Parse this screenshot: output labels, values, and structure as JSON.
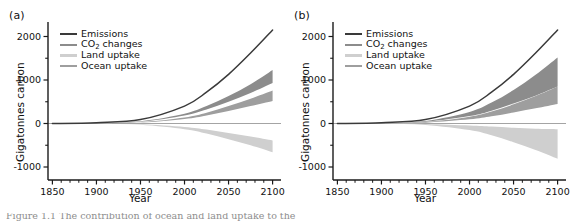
{
  "figure": {
    "width": 569,
    "height": 222,
    "background": "#ffffff",
    "caption_partial": "Figure 1.1  The contribution of ocean and land uptake to the"
  },
  "colors": {
    "emissions": "#3a3a3a",
    "co2_changes": "#8c8c8c",
    "land_uptake": "#cfcfcf",
    "ocean_uptake": "#9e9e9e",
    "axis": "#1a1a1a",
    "zero_line": "#9a9a9a",
    "text": "#111111"
  },
  "axes": {
    "ylabel": "Gigatonnes carbon",
    "xlabel": "Year",
    "ylim": [
      -1400,
      2350
    ],
    "xlim": [
      1845,
      2105
    ],
    "ytick_values": [
      2000,
      1000,
      0,
      -1000
    ],
    "ytick_labels": [
      "2000",
      "1000",
      "0",
      "-1000"
    ],
    "yminor_values": [
      1500,
      500,
      -500
    ],
    "xtick_values": [
      1850,
      1900,
      1950,
      2000,
      2050,
      2100
    ],
    "xtick_labels": [
      "1850",
      "1900",
      "1950",
      "2000",
      "2050",
      "2100"
    ],
    "xminor_step": 10,
    "grid": false
  },
  "legend": {
    "position": "upper-left-inside",
    "entries": [
      {
        "label": "Emissions",
        "key": "emissions",
        "color": "#3a3a3a",
        "has_subscript": false
      },
      {
        "label": "CO2 changes",
        "key": "co2_changes",
        "color": "#8c8c8c",
        "has_subscript": true,
        "label_main": "CO",
        "label_sub": "2",
        "label_tail": " changes"
      },
      {
        "label": "Land uptake",
        "key": "land_uptake",
        "color": "#cfcfcf",
        "has_subscript": false
      },
      {
        "label": "Ocean uptake",
        "key": "ocean_uptake",
        "color": "#9e9e9e",
        "has_subscript": false
      }
    ]
  },
  "panels": [
    {
      "id": "a",
      "tag": "(a)"
    },
    {
      "id": "b",
      "tag": "(b)"
    }
  ],
  "chart_data": [
    {
      "type": "area",
      "panel": "a",
      "title": "(a)",
      "xlabel": "Year",
      "ylabel": "Gigatonnes carbon",
      "xlim": [
        1845,
        2105
      ],
      "ylim": [
        -1400,
        2350
      ],
      "grid": false,
      "legend_position": "upper left",
      "x": [
        1850,
        1900,
        1950,
        2000,
        2025,
        2050,
        2075,
        2100
      ],
      "series": [
        {
          "name": "Emissions",
          "kind": "line",
          "color": "#3a3a3a",
          "values": [
            0,
            20,
            90,
            400,
            720,
            1130,
            1620,
            2150
          ]
        },
        {
          "name": "CO2 changes",
          "kind": "band",
          "color": "#8c8c8c",
          "upper": [
            0,
            12,
            52,
            225,
            400,
            630,
            900,
            1230
          ],
          "lower": [
            0,
            9,
            42,
            185,
            320,
            500,
            700,
            930
          ]
        },
        {
          "name": "Ocean uptake",
          "kind": "band",
          "color": "#9e9e9e",
          "upper": [
            0,
            7,
            30,
            140,
            250,
            400,
            570,
            760
          ],
          "lower": [
            0,
            5,
            22,
            105,
            185,
            290,
            400,
            520
          ]
        },
        {
          "name": "Land uptake",
          "kind": "band",
          "color": "#cfcfcf",
          "upper": [
            0,
            -4,
            -18,
            -80,
            -140,
            -220,
            -300,
            -390
          ],
          "lower": [
            0,
            -6,
            -28,
            -130,
            -230,
            -360,
            -500,
            -660
          ]
        }
      ]
    },
    {
      "type": "area",
      "panel": "b",
      "title": "(b)",
      "xlabel": "Year",
      "ylabel": "Gigatonnes carbon",
      "xlim": [
        1845,
        2105
      ],
      "ylim": [
        -1400,
        2350
      ],
      "grid": false,
      "legend_position": "upper left",
      "x": [
        1850,
        1900,
        1950,
        2000,
        2025,
        2050,
        2075,
        2100
      ],
      "series": [
        {
          "name": "Emissions",
          "kind": "line",
          "color": "#3a3a3a",
          "values": [
            0,
            20,
            90,
            400,
            720,
            1130,
            1620,
            2150
          ]
        },
        {
          "name": "CO2 changes",
          "kind": "band",
          "color": "#8c8c8c",
          "upper": [
            0,
            14,
            60,
            265,
            480,
            770,
            1120,
            1520
          ],
          "lower": [
            0,
            8,
            38,
            170,
            295,
            460,
            640,
            850
          ]
        },
        {
          "name": "Ocean uptake",
          "kind": "band",
          "color": "#9e9e9e",
          "upper": [
            0,
            8,
            34,
            155,
            275,
            440,
            630,
            850
          ],
          "lower": [
            0,
            4,
            20,
            95,
            165,
            255,
            350,
            450
          ]
        },
        {
          "name": "Land uptake",
          "kind": "band",
          "color": "#cfcfcf",
          "upper": [
            0,
            -2,
            -10,
            -45,
            -70,
            -100,
            -120,
            -130
          ],
          "lower": [
            0,
            -7,
            -32,
            -150,
            -270,
            -430,
            -610,
            -810
          ]
        }
      ]
    }
  ]
}
